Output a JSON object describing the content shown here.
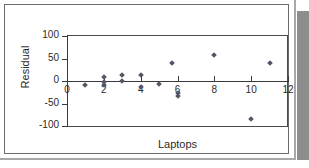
{
  "chart_data": {
    "type": "scatter",
    "title": "",
    "xlabel": "Laptops",
    "ylabel": "Residual",
    "xlim": [
      0,
      12
    ],
    "ylim": [
      -100,
      100
    ],
    "xticks": [
      "0",
      "2",
      "4",
      "6",
      "8",
      "10",
      "12"
    ],
    "xtick_values": [
      0,
      2,
      4,
      6,
      8,
      10,
      12
    ],
    "yticks": [
      "100",
      "50",
      "0",
      "-50",
      "-100"
    ],
    "ytick_values": [
      100,
      50,
      0,
      -50,
      -100
    ],
    "grid": false,
    "legend": null,
    "marker": "diamond",
    "marker_color": "#555566",
    "points": [
      {
        "x": 1,
        "y": -10
      },
      {
        "x": 2,
        "y": 8
      },
      {
        "x": 2,
        "y": -3
      },
      {
        "x": 2,
        "y": -11
      },
      {
        "x": 3,
        "y": 12
      },
      {
        "x": 3,
        "y": -1
      },
      {
        "x": 4,
        "y": 12
      },
      {
        "x": 4,
        "y": -15
      },
      {
        "x": 5,
        "y": -8
      },
      {
        "x": 5.7,
        "y": 40
      },
      {
        "x": 6,
        "y": -27
      },
      {
        "x": 6,
        "y": -34
      },
      {
        "x": 8,
        "y": 57
      },
      {
        "x": 10,
        "y": -85
      },
      {
        "x": 11,
        "y": 40
      }
    ]
  },
  "colors": {
    "marker": "#555566",
    "axis": "#3a3a3a",
    "frame": "#4a4a4a",
    "card_border": "#6b6b6b",
    "shadow": "#8d8d8d",
    "text": "#2b2b2b",
    "background": "#ffffff"
  }
}
